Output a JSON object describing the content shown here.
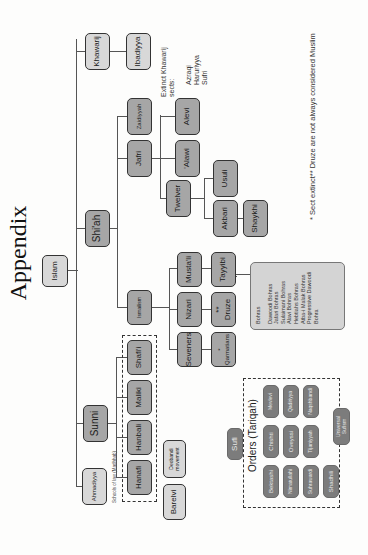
{
  "page": {
    "title": "Appendix",
    "orientation": "rotated 90° counter-clockwise",
    "footnote": "* Sect extinct** Druze are not always considered Muslim"
  },
  "tree": {
    "root": "Islam",
    "branches": {
      "khawarij": "Khawarij",
      "ibadiyya": "Ibadiyya",
      "shiah": "Shi'ah",
      "sunni": "Sunni",
      "ahmadiyya": "Ahmadiyya"
    },
    "extinct_khawarij": {
      "heading": "Extinct Khawarij\nsects:",
      "items": "Azraqi\nHaruriyya\nSufri"
    },
    "shiah": {
      "zaidiyyah": "Zaidiyyah",
      "jafri": "Jafri",
      "ismailism": "Ismailism",
      "alevi": "Alevi",
      "alawi": "'Alawi",
      "twelver": "Twelver",
      "usuli": "Usuli",
      "akbari": "Akbari",
      "shaykhi": "Shaykhi",
      "mustali": "Musta'li",
      "nizari": "Nizari",
      "seveners": "Seveners",
      "tayyibi": "Tayyibi",
      "druze": "**\nDruze",
      "qarmatians": "*\nQarmatians"
    },
    "bohras": {
      "heading": "Bohras",
      "items": [
        "Dawoodi Bohras",
        "Jafari Bohras",
        "Sulaimani Bohras",
        "Alavi Bohras",
        "Hebtiahs Bohras",
        "Atba-i Malak Bohras",
        "Progressive Dawoodi",
        "Bohra"
      ]
    },
    "sunni": {
      "schools_label": "Schools of law (Madhhab)",
      "hanafi": "Hanafi",
      "hanbali": "Hanbali",
      "maliki": "Maliki",
      "shafii": "Shafi'i",
      "deobandi": "Deobandi\nmovement",
      "barelvi": "Barelvi"
    },
    "sufi": {
      "label": "Sufi",
      "orders_title": "Orders (Tariqah)",
      "orders_row1": [
        "Mevlevi",
        "Qadiriyya",
        "Naqshbandi"
      ],
      "orders_row2": [
        "Chishti",
        "Oveyssi",
        "Tijaniyyah"
      ],
      "orders_row3": [
        "Bektashi",
        "Nimatullahi",
        "Suhrawardi",
        "Shadhili"
      ],
      "universal": "Universal\nSufism"
    }
  },
  "colors": {
    "node_light": "#d8d8d8",
    "node_mid": "#a6a6a6",
    "node_dark": "#7c7c7c",
    "line": "#555555"
  }
}
